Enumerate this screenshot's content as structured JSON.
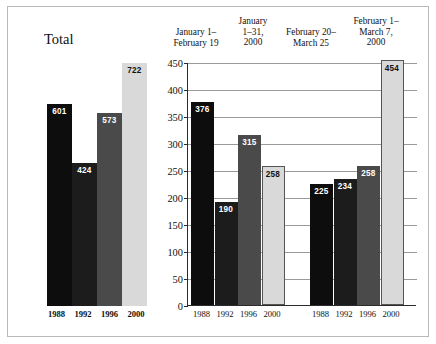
{
  "chart_data": {
    "type": "bar",
    "title": "",
    "xlabel": "",
    "ylabel": "",
    "ylim": [
      0,
      450
    ],
    "ytick_step": 50,
    "yticks": [
      0,
      50,
      100,
      150,
      200,
      250,
      300,
      350,
      400,
      450
    ],
    "grid": true,
    "legend_position": "none",
    "categories": [
      "1988",
      "1992",
      "1996",
      "2000"
    ],
    "panels": [
      {
        "name": "total",
        "label": "Total",
        "has_axis": false,
        "categories": [
          "1988",
          "1992",
          "1996",
          "2000"
        ],
        "values": [
          601,
          424,
          573,
          722
        ]
      },
      {
        "name": "january-1-february-19",
        "header": "January 1–\nFebruary 19",
        "categories": [
          "1988",
          "1992",
          "1996",
          "2000"
        ],
        "values": [
          376,
          190,
          315,
          258
        ]
      },
      {
        "name": "february-20-march-25",
        "header": "February 20–\nMarch 25",
        "categories": [
          "1988",
          "1992",
          "1996",
          "2000"
        ],
        "values": [
          225,
          234,
          258,
          454
        ]
      }
    ],
    "secondary_headers": [
      {
        "name": "january-1-31-2000",
        "text": "January\n1–31,\n2000"
      },
      {
        "name": "february-1-march-7-2000",
        "text": "February 1–\nMarch 7,\n2000"
      }
    ],
    "series_colors": [
      "#0d0d0d",
      "#1c1c1c",
      "#4a4a4a",
      "#d9d9d9"
    ]
  },
  "headers": {
    "a": "January 1–\nFebruary 19",
    "b": "January\n1–31,\n2000",
    "c": "February 20–\nMarch 25",
    "d": "February 1–\nMarch 7,\n2000"
  },
  "total": {
    "label": "Total",
    "bars": [
      {
        "category": "1988",
        "value": 601,
        "value_text": "601",
        "color": "#0d0d0d",
        "label_color": "light"
      },
      {
        "category": "1992",
        "value": 424,
        "value_text": "424",
        "color": "#1c1c1c",
        "label_color": "light"
      },
      {
        "category": "1996",
        "value": 573,
        "value_text": "573",
        "color": "#4a4a4a",
        "label_color": "light"
      },
      {
        "category": "2000",
        "value": 722,
        "value_text": "722",
        "color": "#d9d9d9",
        "label_color": "dark"
      }
    ],
    "xlabels": [
      "1988",
      "1992",
      "1996",
      "2000"
    ]
  },
  "plot": {
    "yticks": [
      "0",
      "50",
      "100",
      "150",
      "200",
      "250",
      "300",
      "350",
      "400",
      "450"
    ],
    "group1": {
      "bars": [
        {
          "category": "1988",
          "value": 376,
          "value_text": "376",
          "color": "#0d0d0d",
          "label_color": "light"
        },
        {
          "category": "1992",
          "value": 190,
          "value_text": "190",
          "color": "#1c1c1c",
          "label_color": "light"
        },
        {
          "category": "1996",
          "value": 315,
          "value_text": "315",
          "color": "#4a4a4a",
          "label_color": "light"
        },
        {
          "category": "2000",
          "value": 258,
          "value_text": "258",
          "color": "#d9d9d9",
          "label_color": "dark"
        }
      ]
    },
    "group2": {
      "bars": [
        {
          "category": "1988",
          "value": 225,
          "value_text": "225",
          "color": "#0d0d0d",
          "label_color": "light"
        },
        {
          "category": "1992",
          "value": 234,
          "value_text": "234",
          "color": "#1c1c1c",
          "label_color": "light"
        },
        {
          "category": "1996",
          "value": 258,
          "value_text": "258",
          "color": "#4a4a4a",
          "label_color": "light"
        },
        {
          "category": "2000",
          "value": 454,
          "value_text": "454",
          "color": "#d9d9d9",
          "label_color": "dark"
        }
      ]
    },
    "xlabels": [
      "1988",
      "1992",
      "1996",
      "2000",
      "1988",
      "1992",
      "1996",
      "2000"
    ]
  }
}
